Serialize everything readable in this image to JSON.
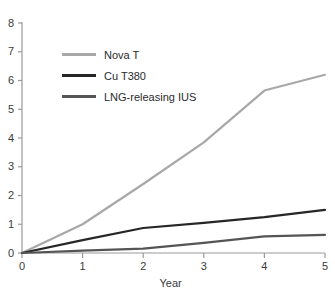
{
  "chart_data": {
    "type": "line",
    "title": "",
    "xlabel": "Year",
    "ylabel": "",
    "xlim": [
      0,
      5
    ],
    "ylim": [
      0,
      8
    ],
    "x": [
      0,
      1,
      2,
      3,
      4,
      5
    ],
    "xticks": [
      "0",
      "1",
      "2",
      "3",
      "4",
      "5"
    ],
    "yticks": [
      "0",
      "1",
      "2",
      "3",
      "4",
      "5",
      "6",
      "7",
      "8"
    ],
    "grid": false,
    "legend_position": "upper-left-inside",
    "series": [
      {
        "name": "Nova T",
        "color": "#a8a8a8",
        "values": [
          0,
          1.0,
          2.4,
          3.85,
          5.65,
          6.2
        ]
      },
      {
        "name": "Cu T380",
        "color": "#262626",
        "values": [
          0,
          0.45,
          0.87,
          1.05,
          1.25,
          1.5
        ]
      },
      {
        "name": "LNG-releasing IUS",
        "color": "#555555",
        "values": [
          0,
          0.08,
          0.15,
          0.35,
          0.58,
          0.63
        ]
      }
    ]
  },
  "axes": {
    "x_title": "Year",
    "axis_color": "#9a9a9a",
    "tick_color": "#9a9a9a",
    "label_color": "#3a3a3a"
  },
  "legend": {
    "items": [
      {
        "label": "Nova T",
        "color": "#a8a8a8"
      },
      {
        "label": "Cu T380",
        "color": "#262626"
      },
      {
        "label": "LNG-releasing IUS",
        "color": "#555555"
      }
    ]
  }
}
